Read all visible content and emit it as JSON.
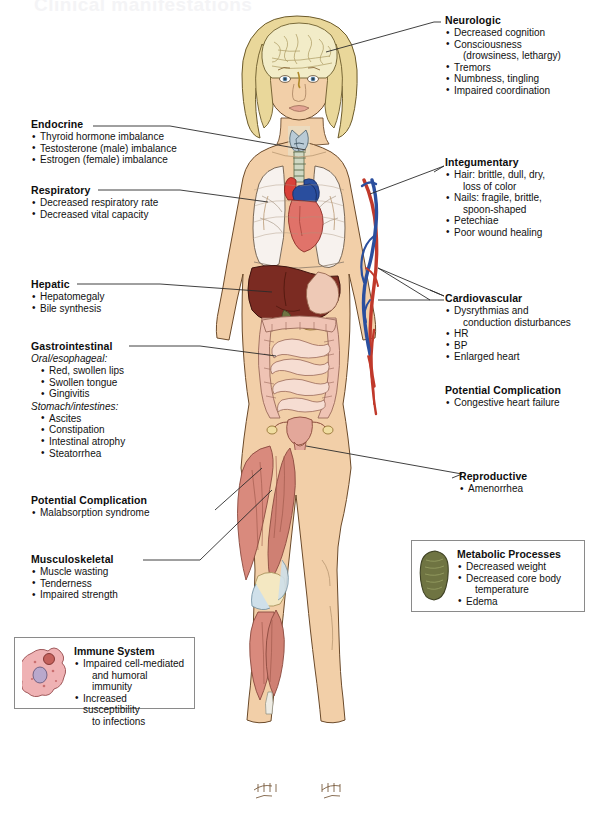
{
  "page": {
    "title_partial": "Clinical manifestations",
    "figure_alt": "Anatomical illustration of a standing female figure with internal organs, musculature and vasculature exposed"
  },
  "callouts": [
    {
      "id": "neurologic",
      "heading": "Neurologic",
      "items": [
        "Decreased cognition",
        "Consciousness",
        "Tremors",
        "Numbness, tingling",
        "Impaired coordination"
      ],
      "item_continuations": {
        "1": "(drowsiness, lethargy)"
      }
    },
    {
      "id": "integumentary",
      "heading": "Integumentary",
      "items": [
        "Hair: brittle, dull, dry,",
        "Nails: fragile, brittle,",
        "Petechiae",
        "Poor wound healing"
      ],
      "item_continuations": {
        "0": "loss of color",
        "1": "spoon-shaped"
      }
    },
    {
      "id": "cardiovascular",
      "heading": "Cardiovascular",
      "items": [
        "Dysrythmias and",
        "HR",
        "BP",
        "Enlarged heart"
      ],
      "item_continuations": {
        "0": "conduction disturbances"
      }
    },
    {
      "id": "cardiovascular-complication",
      "heading": "Potential Complication",
      "items": [
        "Congestive heart failure"
      ]
    },
    {
      "id": "reproductive",
      "heading": "Reproductive",
      "items": [
        "Amenorrhea"
      ]
    },
    {
      "id": "endocrine",
      "heading": "Endocrine",
      "items": [
        "Thyroid hormone imbalance",
        "Testosterone (male) imbalance",
        "Estrogen (female) imbalance"
      ]
    },
    {
      "id": "respiratory",
      "heading": "Respiratory",
      "items": [
        "Decreased respiratory rate",
        "Decreased vital capacity"
      ]
    },
    {
      "id": "hepatic",
      "heading": "Hepatic",
      "items": [
        "Hepatomegaly",
        "Bile synthesis"
      ]
    },
    {
      "id": "gastrointestinal",
      "heading": "Gastrointestinal",
      "subheading_1": "Oral/esophageal:",
      "group_1": [
        "Red, swollen lips",
        "Swollen tongue",
        "Gingivitis"
      ],
      "subheading_2": "Stomach/intestines:",
      "group_2": [
        "Ascites",
        "Constipation",
        "Intestinal atrophy",
        "Steatorrhea"
      ]
    },
    {
      "id": "gi-complication",
      "heading": "Potential Complication",
      "items": [
        "Malabsorption syndrome"
      ]
    },
    {
      "id": "musculoskeletal",
      "heading": "Musculoskeletal",
      "items": [
        "Muscle wasting",
        "Tenderness",
        "Impaired strength"
      ]
    }
  ],
  "boxed_callouts": [
    {
      "id": "immune-system",
      "heading": "Immune System",
      "icon": "macrophage-cell-icon",
      "items": [
        "Impaired cell-mediated",
        "Increased susceptibility"
      ],
      "item_continuations": {
        "0": "and humoral immunity",
        "1": "to infections"
      }
    },
    {
      "id": "metabolic-processes",
      "heading": "Metabolic Processes",
      "icon": "mitochondrion-icon",
      "items": [
        "Decreased weight",
        "Decreased core body",
        "Edema"
      ],
      "item_continuations": {
        "1": "temperature"
      }
    }
  ],
  "colors": {
    "skin": "#f2cfa8",
    "skin_shadow": "#e3b98c",
    "hair": "#e9d79a",
    "brain": "#f2ecc8",
    "heart_artery": "#d9413a",
    "vein": "#2b4f9e",
    "liver": "#7b2b22",
    "intestine": "#efc3b4",
    "muscle": "#d98a7d",
    "lung": "#f7f2ee",
    "thyroid": "#b9cbd6",
    "uterus": "#e3a79a",
    "mitochondrion": "#6f7442",
    "immune_cell": "#efb2b4",
    "leader_line": "#2b2b2b",
    "box_border": "#8a8a8a"
  }
}
